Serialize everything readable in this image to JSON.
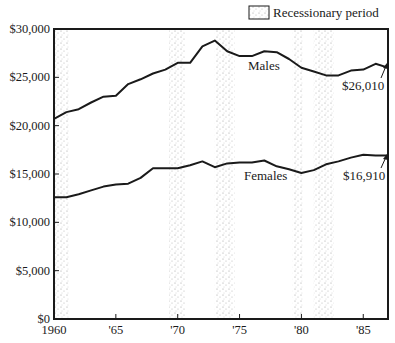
{
  "chart_data": {
    "type": "line",
    "title": "",
    "xlabel": "",
    "ylabel": "",
    "x": [
      1960,
      1961,
      1962,
      1963,
      1964,
      1965,
      1966,
      1967,
      1968,
      1969,
      1970,
      1971,
      1972,
      1973,
      1974,
      1975,
      1976,
      1977,
      1978,
      1979,
      1980,
      1981,
      1982,
      1983,
      1984,
      1985,
      1986,
      1987
    ],
    "series": [
      {
        "name": "Males",
        "values": [
          20700,
          21400,
          21700,
          22400,
          23000,
          23100,
          24300,
          24800,
          25400,
          25800,
          26500,
          26500,
          28200,
          28800,
          27700,
          27200,
          27200,
          27700,
          27600,
          26900,
          26000,
          25600,
          25200,
          25200,
          25700,
          25800,
          26400,
          26010
        ],
        "end_label": "$26,010"
      },
      {
        "name": "Females",
        "values": [
          12600,
          12600,
          12900,
          13300,
          13700,
          13900,
          14000,
          14600,
          15600,
          15600,
          15600,
          15900,
          16300,
          15700,
          16100,
          16200,
          16200,
          16400,
          15800,
          15500,
          15100,
          15400,
          16000,
          16300,
          16700,
          17000,
          16910,
          16910
        ],
        "end_label": "$16,910"
      }
    ],
    "shaded_periods": [
      {
        "start": 1960.0,
        "end": 1961.2
      },
      {
        "start": 1969.3,
        "end": 1970.6
      },
      {
        "start": 1973.0,
        "end": 1974.6
      },
      {
        "start": 1979.3,
        "end": 1980.1
      },
      {
        "start": 1981.0,
        "end": 1982.6
      }
    ],
    "xlim": [
      1960,
      1987
    ],
    "ylim": [
      0,
      30000
    ],
    "x_ticks": [
      1960,
      1965,
      1970,
      1975,
      1980,
      1985
    ],
    "x_tick_labels": [
      "1960",
      "'65",
      "'70",
      "'75",
      "'80",
      "'85"
    ],
    "y_ticks": [
      0,
      5000,
      10000,
      15000,
      20000,
      25000,
      30000
    ],
    "y_tick_labels": [
      "$0",
      "$5,000",
      "$10,000",
      "$15,000",
      "$20,000",
      "$25,000",
      "$30,000"
    ],
    "legend": {
      "position": "top-right",
      "entries": [
        "Recessionary period"
      ]
    },
    "grid": false
  },
  "legend": {
    "label": "Recessionary period"
  },
  "labels": {
    "males": "Males",
    "females": "Females",
    "males_end": "$26,010",
    "females_end": "$16,910"
  },
  "colors": {
    "line": "#1a1a1a",
    "shade_dot": "#9a9a9a",
    "axis": "#1a1a1a"
  }
}
